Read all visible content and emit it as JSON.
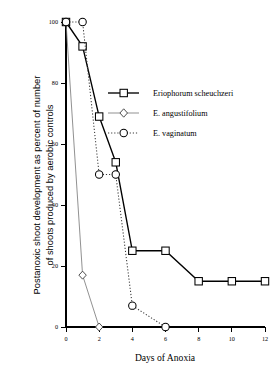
{
  "chart_data": {
    "type": "line",
    "title": "",
    "xlabel": "Days of Anoxia",
    "ylabel": "Postanoxic shoot development as percent of number\nof shoots  produced by aerobic controls",
    "xlim": [
      0,
      12
    ],
    "ylim": [
      0,
      100
    ],
    "xticks": [
      0,
      2,
      4,
      6,
      8,
      10,
      12
    ],
    "xtick_labels": [
      "0",
      "2",
      "4",
      "6",
      "8",
      "10",
      "12"
    ],
    "yticks": [
      0,
      20,
      40,
      60,
      80,
      100
    ],
    "ytick_labels": [
      "0",
      "20",
      "40",
      "60",
      "80",
      "100"
    ],
    "grid": false,
    "legend_position": "upper-center-right",
    "series": [
      {
        "name": "Eriophorum  scheuchzeri",
        "marker": "square",
        "linestyle": "solid",
        "color": "#000000",
        "x": [
          0,
          1,
          2,
          3,
          4,
          6,
          8,
          10,
          12
        ],
        "values": [
          100,
          92,
          69,
          54,
          25,
          25,
          15,
          15,
          15
        ]
      },
      {
        "name": "E. angustifolium",
        "marker": "diamond",
        "linestyle": "thin-solid",
        "color": "#7d7d7d",
        "x": [
          0,
          1,
          2
        ],
        "values": [
          100,
          17,
          0
        ]
      },
      {
        "name": "E. vaginatum",
        "marker": "circle",
        "linestyle": "dotted",
        "color": "#3a3a3a",
        "x": [
          0,
          1,
          2,
          3,
          4,
          6
        ],
        "values": [
          100,
          100,
          50,
          50,
          7,
          0
        ]
      }
    ]
  },
  "legend": {
    "entries": [
      {
        "label": "Eriophorum  scheuchzeri"
      },
      {
        "label": "E. angustifolium"
      },
      {
        "label": "E. vaginatum"
      }
    ]
  },
  "axes": {
    "x_title": "Days of Anoxia",
    "y_title_line1": "Postanoxic shoot development as percent of number",
    "y_title_line2": "of shoots  produced by aerobic controls"
  }
}
